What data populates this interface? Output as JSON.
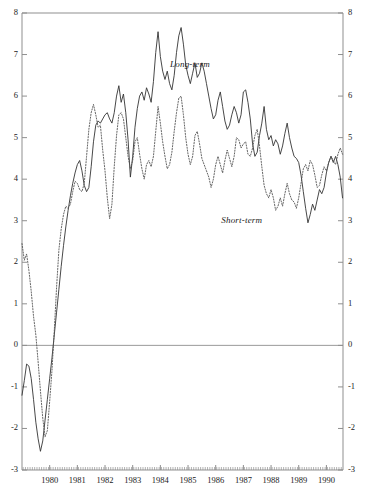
{
  "chart_data": {
    "type": "line",
    "title": "",
    "subtitle": "",
    "xlabel": "",
    "ylabel": "",
    "grid": false,
    "legend_position": "inline-annotation",
    "xlim": [
      1979.0,
      1990.6
    ],
    "ylim": [
      -3,
      8
    ],
    "y_ticks": [
      8,
      7,
      6,
      5,
      4,
      3,
      2,
      1,
      0,
      -1,
      -2,
      -3
    ],
    "y_tick_labels_left": [
      "8",
      "7",
      "6",
      "5",
      "4",
      "3",
      "2",
      "1",
      "0",
      "-1",
      "-2",
      "-3"
    ],
    "y_tick_labels_right": [
      "8",
      "7",
      "6",
      "5",
      "4",
      "3",
      "2",
      "1",
      "0",
      "-1",
      "-2",
      "-3"
    ],
    "x_ticks": [
      1980,
      1981,
      1982,
      1983,
      1984,
      1985,
      1986,
      1987,
      1988,
      1989,
      1990
    ],
    "x_tick_labels": [
      "1980",
      "1981",
      "1982",
      "1983",
      "1984",
      "1985",
      "1986",
      "1987",
      "1988",
      "1989",
      "1990"
    ],
    "x_minor_tick_interval": 0.0833,
    "zero_line": 0,
    "annotations": [
      {
        "text": "Long-term",
        "x": 1984.35,
        "y": 6.75,
        "style": "italic"
      },
      {
        "text": "Short-term",
        "x": 1986.2,
        "y": 3.0,
        "style": "italic"
      }
    ],
    "series": [
      {
        "name": "Long-term",
        "label": "Long-term",
        "style": "solid",
        "color": "#333333",
        "x_start": 1979.0,
        "x_step": 0.08333,
        "values": [
          -1.2,
          -0.85,
          -0.45,
          -0.5,
          -0.8,
          -1.3,
          -1.85,
          -2.25,
          -2.55,
          -2.3,
          -1.8,
          -1.3,
          -0.8,
          -0.3,
          0.25,
          0.8,
          1.35,
          1.9,
          2.4,
          2.85,
          3.25,
          3.6,
          3.9,
          4.15,
          4.35,
          4.45,
          4.2,
          3.85,
          3.7,
          3.8,
          4.3,
          4.9,
          5.3,
          5.4,
          5.35,
          5.45,
          5.55,
          5.6,
          5.45,
          5.35,
          5.6,
          6.0,
          6.25,
          5.85,
          6.05,
          5.6,
          4.95,
          4.05,
          4.55,
          5.25,
          5.7,
          6.0,
          6.1,
          5.9,
          6.2,
          6.05,
          5.85,
          6.35,
          7.05,
          7.55,
          6.95,
          6.6,
          6.4,
          6.6,
          6.3,
          6.15,
          6.5,
          7.05,
          7.45,
          7.65,
          7.25,
          6.75,
          6.5,
          6.3,
          6.55,
          6.8,
          6.45,
          6.55,
          6.8,
          6.6,
          6.3,
          6.0,
          5.7,
          5.45,
          5.55,
          5.9,
          6.1,
          5.75,
          5.4,
          5.2,
          5.3,
          5.55,
          5.75,
          5.6,
          5.35,
          5.55,
          6.1,
          6.15,
          5.85,
          5.45,
          4.85,
          4.55,
          4.65,
          5.05,
          5.35,
          5.75,
          5.2,
          4.95,
          5.05,
          4.8,
          4.95,
          4.85,
          4.6,
          4.8,
          5.1,
          5.35,
          5.0,
          4.75,
          4.55,
          4.5,
          4.4,
          4.1,
          3.7,
          3.3,
          2.95,
          3.15,
          3.4,
          3.25,
          3.5,
          3.75,
          3.65,
          3.8,
          4.15,
          4.4,
          4.55,
          4.4,
          4.55,
          4.35,
          4.05,
          3.55,
          2.95
        ]
      },
      {
        "name": "Short-term",
        "label": "Short-term",
        "style": "dotted",
        "color": "#555555",
        "x_start": 1979.0,
        "x_step": 0.08333,
        "values": [
          2.45,
          2.05,
          2.2,
          1.8,
          1.3,
          0.7,
          0.25,
          -0.4,
          -1.1,
          -1.75,
          -2.2,
          -2.05,
          -1.35,
          -0.6,
          0.35,
          1.4,
          2.3,
          2.8,
          3.15,
          3.35,
          3.3,
          3.4,
          3.7,
          3.95,
          3.9,
          3.75,
          3.7,
          3.9,
          4.55,
          5.2,
          5.6,
          5.8,
          5.55,
          5.25,
          5.3,
          4.7,
          4.2,
          3.55,
          3.05,
          3.4,
          4.3,
          5.05,
          5.55,
          5.6,
          5.45,
          5.0,
          4.55,
          4.25,
          4.45,
          4.9,
          5.0,
          4.6,
          4.25,
          4.0,
          4.35,
          4.45,
          4.3,
          4.55,
          5.15,
          5.75,
          5.35,
          4.9,
          4.55,
          4.25,
          4.35,
          4.65,
          5.15,
          5.6,
          5.95,
          6.0,
          5.55,
          5.0,
          4.6,
          4.35,
          4.55,
          5.05,
          5.15,
          4.85,
          4.5,
          4.35,
          4.2,
          4.05,
          3.8,
          4.0,
          4.35,
          4.55,
          4.35,
          4.15,
          4.45,
          4.7,
          4.5,
          4.3,
          4.55,
          5.0,
          4.95,
          4.75,
          4.85,
          4.9,
          4.6,
          4.55,
          4.75,
          5.05,
          5.2,
          4.8,
          4.3,
          3.85,
          3.65,
          3.55,
          3.75,
          3.55,
          3.25,
          3.35,
          3.55,
          3.35,
          3.65,
          3.9,
          3.65,
          3.5,
          3.45,
          3.3,
          3.55,
          3.9,
          4.25,
          4.35,
          4.2,
          4.45,
          4.35,
          4.1,
          3.8,
          3.85,
          4.1,
          4.3,
          4.2,
          4.4,
          4.55,
          4.45,
          4.35,
          4.6,
          4.75,
          4.6,
          4.25,
          3.95,
          3.6,
          3.5
        ]
      }
    ]
  },
  "axes": {
    "left_label_id": "left-axis",
    "right_label_id": "right-axis",
    "bottom_label_id": "bottom-axis"
  }
}
